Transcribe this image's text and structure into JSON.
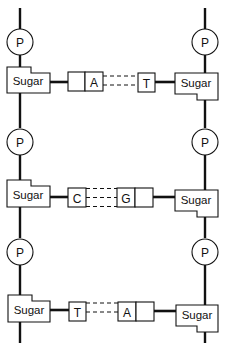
{
  "diagram": {
    "phosphate_label": "P",
    "sugar_label": "Sugar",
    "left_strand": {
      "phosphates": [
        "P",
        "P",
        "P"
      ],
      "sugars": [
        "Sugar",
        "Sugar",
        "Sugar"
      ]
    },
    "right_strand": {
      "phosphates": [
        "P",
        "P",
        "P"
      ],
      "sugars": [
        "Sugar",
        "Sugar",
        "Sugar"
      ]
    },
    "base_pairs": [
      {
        "left": "A",
        "right": "T",
        "hydrogen_bonds": 2
      },
      {
        "left": "C",
        "right": "G",
        "hydrogen_bonds": 3
      },
      {
        "left": "T",
        "right": "A",
        "hydrogen_bonds": 2
      }
    ],
    "colors": {
      "ink": "#111111",
      "background": "#ffffff"
    }
  }
}
